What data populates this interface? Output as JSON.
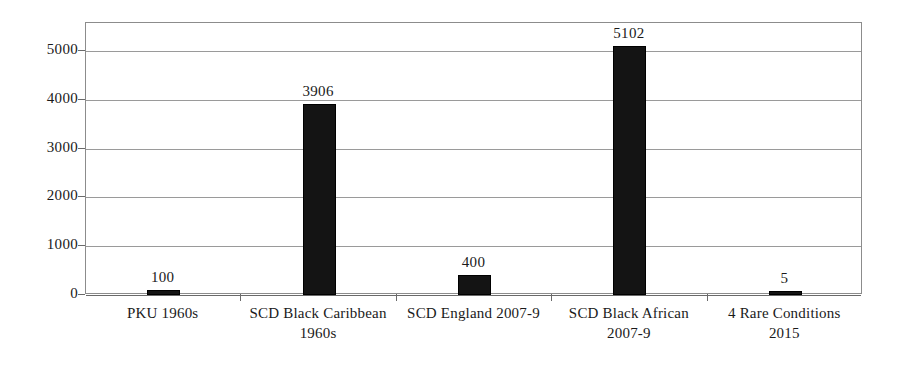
{
  "chart_data": {
    "type": "bar",
    "title": "",
    "subtitle": "",
    "xlabel": "",
    "ylabel": "",
    "categories": [
      "PKU 1960s",
      "SCD Black Caribbean 1960s",
      "SCD England 2007-9",
      "SCD Black African 2007-9",
      "4 Rare Conditions 2015"
    ],
    "category_lines": [
      [
        "PKU 1960s",
        ""
      ],
      [
        "SCD Black Caribbean",
        "1960s"
      ],
      [
        "SCD England 2007-9",
        ""
      ],
      [
        "SCD Black African",
        "2007-9"
      ],
      [
        "4 Rare Conditions",
        "2015"
      ]
    ],
    "values": [
      100,
      3906,
      400,
      5102,
      5
    ],
    "value_labels": [
      "100",
      "3906",
      "400",
      "5102",
      "5"
    ],
    "ylim": [
      0,
      5570
    ],
    "yticks": [
      0,
      1000,
      2000,
      3000,
      4000,
      5000
    ],
    "ytick_labels": [
      "0",
      "1000",
      "2000",
      "3000",
      "4000",
      "5000"
    ],
    "grid": true,
    "legend": false,
    "legend_position": "none",
    "bar_color": "#141414",
    "gridline_color": "#9a9a9a",
    "axis_color": "#6a6a6a",
    "background_color": "#ffffff",
    "text_color": "#1a1a1a"
  }
}
